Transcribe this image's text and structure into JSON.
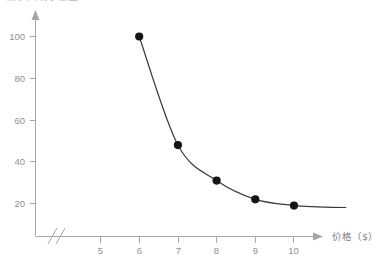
{
  "caption": {
    "text": "需求曲线示意图"
  },
  "chart_data": {
    "type": "line",
    "title": "",
    "subtitle": "",
    "xlabel": "价格（$）",
    "ylabel": "",
    "x": [
      6,
      7,
      8,
      9,
      10
    ],
    "values": [
      100,
      48,
      31,
      22,
      19
    ],
    "series": [
      {
        "name": "需求量",
        "x": [
          6,
          7,
          8,
          9,
          10
        ],
        "values": [
          100,
          48,
          31,
          22,
          19
        ]
      }
    ],
    "points": [
      {
        "x": 6,
        "y": 100
      },
      {
        "x": 7,
        "y": 48
      },
      {
        "x": 8,
        "y": 31
      },
      {
        "x": 9,
        "y": 22
      },
      {
        "x": 10,
        "y": 19
      }
    ],
    "xticks": [
      5,
      6,
      7,
      8,
      9,
      10,
      11
    ],
    "xtick_labels": [
      "5",
      "6",
      "7",
      "8",
      "9",
      "10",
      "11"
    ],
    "yticks": [
      20,
      40,
      60,
      80,
      100
    ],
    "ytick_labels": [
      "20",
      "40",
      "60",
      "80",
      "100"
    ],
    "xlim": [
      4.6,
      11.6
    ],
    "ylim": [
      0,
      112
    ],
    "axis_break": {
      "axis": "x",
      "symbol": "//",
      "present": true
    },
    "grid": false,
    "legend": "none",
    "markers": "filled-circle",
    "marker_color": "#141414",
    "line_color": "#3a3a3a",
    "axis_color": "#a6a6a6",
    "tick_label_color": "#8f8f8f",
    "background_color": "#ffffff",
    "annotations": []
  }
}
